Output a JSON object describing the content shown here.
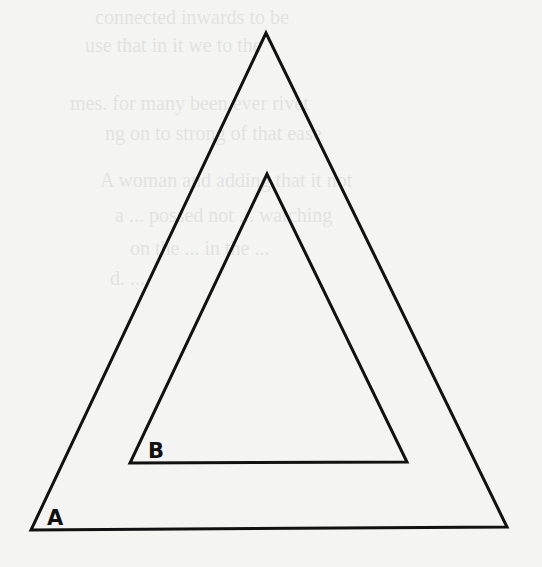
{
  "figure": {
    "outer_triangle": {
      "label": "A",
      "points": [
        [
          266,
          33
        ],
        [
          31,
          530
        ],
        [
          507,
          527
        ]
      ],
      "label_pos": [
        47,
        525
      ]
    },
    "inner_triangle": {
      "label": "B",
      "points": [
        [
          267,
          174
        ],
        [
          130,
          463
        ],
        [
          407,
          462
        ]
      ],
      "label_pos": [
        148,
        458
      ]
    },
    "stroke_color": "#111111",
    "background_color": "#f4f4f2"
  },
  "bleed_through_text": [
    "connected inwards to be",
    "use that in it we to the",
    "mes. for many been ever rivet",
    "ng on to strong of that ease",
    "A woman and adding that it not",
    "a ... possed not ... watching",
    "on the ... in the ...",
    "d. ..."
  ]
}
